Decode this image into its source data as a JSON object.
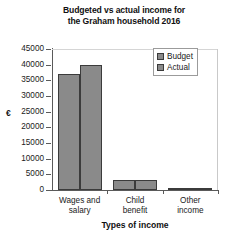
{
  "chart_data": {
    "type": "bar",
    "title": "Budgeted vs actual income for the Graham household 2016",
    "title_lines": [
      "Budgeted vs actual income for",
      "the Graham household 2016"
    ],
    "xlabel": "Types of income",
    "ylabel": "€",
    "categories": [
      "Wages and salary",
      "Child benefit",
      "Other income"
    ],
    "category_lines": [
      [
        "Wages and",
        "salary"
      ],
      [
        "Child",
        "benefit"
      ],
      [
        "Other",
        "income"
      ]
    ],
    "series": [
      {
        "name": "Budget",
        "values": [
          37000,
          3300,
          600
        ]
      },
      {
        "name": "Actual",
        "values": [
          40000,
          3300,
          800
        ]
      }
    ],
    "ylim": [
      0,
      45000
    ],
    "ytick_values": [
      0,
      5000,
      10000,
      15000,
      20000,
      25000,
      30000,
      35000,
      40000,
      45000
    ],
    "ytick_labels": [
      "0",
      "5000",
      "10000",
      "15000",
      "20000",
      "25000",
      "30000",
      "35000",
      "40000",
      "45000"
    ],
    "grid": false,
    "legend_position": "top-right",
    "colors": {
      "bar_fill": "#8a8a8a",
      "bar_edge": "#3b3b3b",
      "axis": "#5a5a5a",
      "text": "#1a1a1a",
      "background": "#ffffff"
    }
  },
  "legend": {
    "items": [
      {
        "label": "Budget"
      },
      {
        "label": "Actual"
      }
    ]
  }
}
